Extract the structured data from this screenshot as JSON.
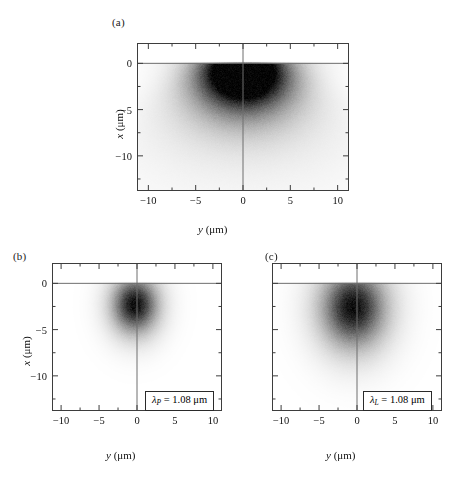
{
  "figure": {
    "background": "#ffffff",
    "ink": "#000000",
    "frame_color": "#4a4a4a",
    "axis_line_color": "#6b6b6b"
  },
  "panels": [
    {
      "tag": "(a)",
      "xlabel_sym": "y",
      "xlabel_unit": "(μm)",
      "ylabel_sym": "x",
      "ylabel_unit": "(μm)",
      "xticks": [
        -10,
        -5,
        0,
        5,
        10
      ],
      "xtick_labels": [
        "−10",
        "−5",
        "0",
        "5",
        "10"
      ],
      "yticks": [
        0,
        -5,
        -10
      ],
      "ytick_labels": [
        "0",
        "−5",
        "−10"
      ],
      "xlim": [
        -11.2,
        11.2
      ],
      "ylim": [
        -13.8,
        2.2
      ],
      "show_ytick_labels": true,
      "show_ylabel": true,
      "legend": null
    },
    {
      "tag": "(b)",
      "xlabel_sym": "y",
      "xlabel_unit": "(μm)",
      "ylabel_sym": "x",
      "ylabel_unit": "(μm)",
      "xticks": [
        -10,
        -5,
        0,
        5,
        10
      ],
      "xtick_labels": [
        "−10",
        "−5",
        "0",
        "5",
        "10"
      ],
      "yticks": [
        0,
        -5,
        -10
      ],
      "ytick_labels": [
        "0",
        "−5",
        "−10"
      ],
      "xlim": [
        -11.2,
        11.2
      ],
      "ylim": [
        -13.8,
        2.2
      ],
      "show_ytick_labels": true,
      "show_ylabel": true,
      "legend": {
        "symbol": "λ",
        "subscript": "P",
        "equals": "=",
        "value": "1.08",
        "unit": "μm"
      }
    },
    {
      "tag": "(c)",
      "xlabel_sym": "y",
      "xlabel_unit": "(μm)",
      "ylabel_sym": "",
      "ylabel_unit": "",
      "xticks": [
        -10,
        -5,
        0,
        5,
        10
      ],
      "xtick_labels": [
        "−10",
        "−5",
        "0",
        "5",
        "10"
      ],
      "yticks": [
        0,
        -5,
        -10
      ],
      "ytick_labels": [
        "",
        "",
        ""
      ],
      "xlim": [
        -11.2,
        11.2
      ],
      "ylim": [
        -13.8,
        2.2
      ],
      "show_ytick_labels": false,
      "show_ylabel": false,
      "legend": {
        "symbol": "λ",
        "subscript": "L",
        "equals": "=",
        "value": "1.08",
        "unit": "μm"
      }
    }
  ],
  "chart_data": {
    "type": "heatmap",
    "title": "",
    "xlabel": "y (μm)",
    "ylabel": "x (μm)",
    "colormap": "grayscale, white = 0 density, black = max density",
    "grid": false,
    "legend_position": "inside lower-right of panels (b) and (c)",
    "panels": [
      {
        "tag": "(a)",
        "description": "Broad hemispherical density cloud hugging the x = 0 surface, peak darkness just below x = 0 and centered near y = 0, long diffuse tail extending to x ≈ -8",
        "xlim": [
          -11.2,
          11.2
        ],
        "ylim": [
          -13.8,
          2.2
        ],
        "surface_line_x": 0,
        "center_y": 0.1,
        "center_x": -1.3,
        "sigma_y": 2.6,
        "sigma_x": 2.3,
        "tail_sigma_y": 3.6,
        "tail_sigma_x": 3.2,
        "peak_intensity": 1.0
      },
      {
        "tag": "(b)",
        "description": "Compact round Gaussian blob detached from the surface, centered near y = -0.3, x = -2.3",
        "xlim": [
          -11.2,
          11.2
        ],
        "ylim": [
          -13.8,
          2.2
        ],
        "surface_line_x": 0,
        "center_y": -0.3,
        "center_x": -2.3,
        "sigma_y": 1.5,
        "sigma_x": 1.5,
        "tail_sigma_y": 2.1,
        "tail_sigma_x": 2.2,
        "peak_intensity": 1.0
      },
      {
        "tag": "(c)",
        "description": "Larger, more diffuse round Gaussian blob, centered near y = -0.5, x = -2.6, roughly 1.5x wider than panel (b)",
        "xlim": [
          -11.2,
          11.2
        ],
        "ylim": [
          -13.8,
          2.2
        ],
        "surface_line_x": 0,
        "center_y": -0.5,
        "center_x": -2.6,
        "sigma_y": 2.1,
        "sigma_x": 2.1,
        "tail_sigma_y": 3.0,
        "tail_sigma_x": 3.1,
        "peak_intensity": 1.0
      }
    ]
  }
}
